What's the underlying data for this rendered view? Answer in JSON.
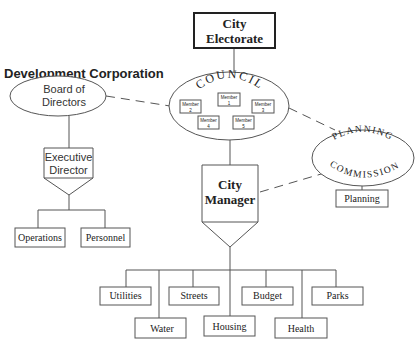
{
  "title": "Development Corporation",
  "electorate": {
    "line1": "City",
    "line2": "Electorate"
  },
  "council": {
    "label": "COUNCIL",
    "members": [
      {
        "label": "Member",
        "num": "1"
      },
      {
        "label": "Member",
        "num": "2"
      },
      {
        "label": "Member",
        "num": "3"
      },
      {
        "label": "Member",
        "num": "4"
      },
      {
        "label": "Member",
        "num": "5"
      }
    ]
  },
  "board": {
    "line1": "Board of",
    "line2": "Directors"
  },
  "executive": {
    "line1": "Executive",
    "line2": "Director"
  },
  "exec_departments": [
    "Operations",
    "Personnel"
  ],
  "manager": {
    "line1": "City",
    "line2": "Manager"
  },
  "planning_commission": {
    "line1": "PLANNING",
    "line2": "COMMISSION"
  },
  "planning": "Planning",
  "departments": {
    "top_row": [
      "Utilities",
      "Streets",
      "Budget",
      "Parks"
    ],
    "bottom_row": [
      "Water",
      "Housing",
      "Health"
    ]
  }
}
